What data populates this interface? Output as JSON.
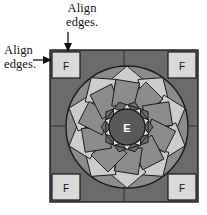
{
  "diagram": {
    "canvas": {
      "width": 207,
      "height": 215
    },
    "colors": {
      "background": "#ffffff",
      "frame_fill": "#6b6b6b",
      "frame_border": "#1a1a1a",
      "corner_square_fill": "#d9d9d9",
      "corner_square_border": "#1a1a1a",
      "star_light": "#cccccc",
      "star_medium": "#8c8c8c",
      "star_dark": "#6b6b6b",
      "center_circle_fill": "#595959",
      "center_circle_border": "#1a1a1a",
      "center_label_color": "#ffffff",
      "outline": "#1a1a1a",
      "text": "#111111"
    },
    "frame": {
      "x": 50,
      "y": 50,
      "width": 148,
      "height": 152
    },
    "medallion": {
      "cx": 127,
      "cy": 127,
      "outer_radius": 61,
      "center_radius": 18,
      "points": 10
    },
    "center_label": "E",
    "corner_labels": [
      {
        "position": "top-left",
        "label": "F"
      },
      {
        "position": "top-right",
        "label": "F"
      },
      {
        "position": "bottom-left",
        "label": "F"
      },
      {
        "position": "bottom-right",
        "label": "F"
      }
    ]
  },
  "callouts": {
    "top": {
      "line1": "Align",
      "line2": "edges.",
      "arrow_direction": "down"
    },
    "left": {
      "line1": "Align",
      "line2": "edges.",
      "arrow_direction": "right"
    }
  }
}
